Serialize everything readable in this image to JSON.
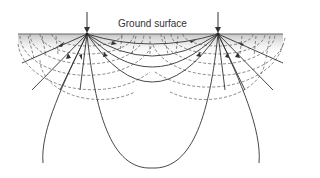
{
  "diagram": {
    "title_label": "Ground surface",
    "elements": {
      "electrodes": [
        {
          "id": "electrode-left",
          "x": 87,
          "y": 34,
          "arrow": "down"
        },
        {
          "id": "electrode-right",
          "x": 218,
          "y": 34,
          "arrow": "down"
        }
      ],
      "ground_surface": {
        "x1": 18,
        "x2": 283,
        "y": 34
      },
      "current_lines": "solid curves with arrowheads from left electrode to right electrode",
      "equipotential_lines": "dashed semicircular curves around each electrode"
    },
    "colors": {
      "line": "#333333",
      "dashed": "#555555",
      "ground_shade_top": "#c8c8c8",
      "ground_shade_bottom": "#ffffff"
    }
  }
}
